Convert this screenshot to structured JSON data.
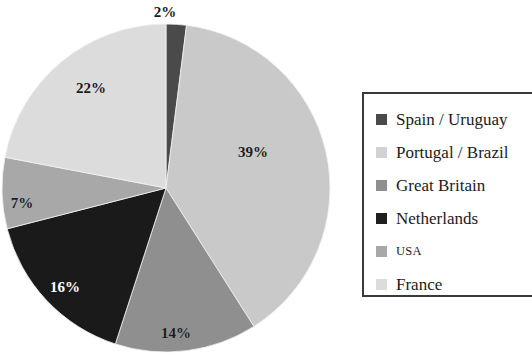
{
  "chart_data": {
    "type": "pie",
    "title": "",
    "subtitle": "",
    "xlabel": "",
    "ylabel": "",
    "legend_position": "right",
    "grid": false,
    "start_angle_deg": 0,
    "direction": "clockwise",
    "units": "percent",
    "categories": [
      "Spain / Uruguay",
      "Portugal / Brazil",
      "Great Britain",
      "Netherlands",
      "USA",
      "France"
    ],
    "values": [
      2,
      39,
      14,
      16,
      7,
      22
    ],
    "labels": [
      "2%",
      "39%",
      "14%",
      "16%",
      "7%",
      "22%"
    ],
    "colors": [
      "#4a4a4a",
      "#c9c9c9",
      "#8f8f8f",
      "#1a1a1a",
      "#a8a8a8",
      "#dcdcdc"
    ],
    "slices": [
      {
        "name": "Spain / Uruguay",
        "value": 2,
        "label": "2%",
        "color": "#4a4a4a",
        "label_color": "dark",
        "label_x": 165,
        "label_y": 12
      },
      {
        "name": "Portugal / Brazil",
        "value": 39,
        "label": "39%",
        "color": "#c9c9c9",
        "label_color": "dark",
        "label_x": 253,
        "label_y": 152
      },
      {
        "name": "Great Britain",
        "value": 14,
        "label": "14%",
        "color": "#8f8f8f",
        "label_color": "dark",
        "label_x": 176,
        "label_y": 333
      },
      {
        "name": "Netherlands",
        "value": 16,
        "label": "16%",
        "color": "#1a1a1a",
        "label_color": "light",
        "label_x": 65,
        "label_y": 287
      },
      {
        "name": "USA",
        "value": 7,
        "label": "7%",
        "color": "#a8a8a8",
        "label_color": "dark",
        "label_x": 22,
        "label_y": 203
      },
      {
        "name": "France",
        "value": 22,
        "label": "22%",
        "color": "#dcdcdc",
        "label_color": "dark",
        "label_x": 91,
        "label_y": 88
      }
    ],
    "geometry": {
      "cx": 166,
      "cy": 188,
      "r": 164
    }
  },
  "legend": {
    "border_color": "#3a3a3a",
    "items": [
      {
        "label": "Spain / Uruguay",
        "color": "#4a4a4a",
        "small": false
      },
      {
        "label": "Portugal / Brazil",
        "color": "#d2d2d2",
        "small": false
      },
      {
        "label": "Great Britain",
        "color": "#8f8f8f",
        "small": false
      },
      {
        "label": "Netherlands",
        "color": "#1f1f1f",
        "small": false
      },
      {
        "label": "USA",
        "color": "#a8a8a8",
        "small": true
      },
      {
        "label": "France",
        "color": "#dcdcdc",
        "small": false
      }
    ]
  }
}
